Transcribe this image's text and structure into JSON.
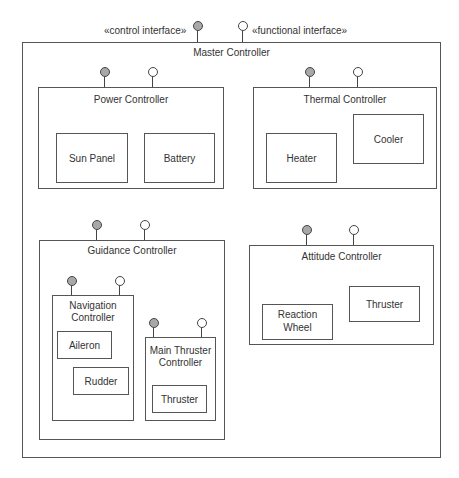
{
  "legend": {
    "control_interface": "«control interface»",
    "functional_interface": "«functional interface»"
  },
  "master": {
    "title": "Master Controller"
  },
  "power": {
    "title": "Power Controller",
    "parts": [
      "Sun Panel",
      "Battery"
    ]
  },
  "thermal": {
    "title": "Thermal Controller",
    "parts": [
      "Heater",
      "Cooler"
    ]
  },
  "guidance": {
    "title": "Guidance Controller",
    "navigation": {
      "title_line1": "Navigation",
      "title_line2": "Controller",
      "parts": [
        "Aileron",
        "Rudder"
      ]
    },
    "main_thruster": {
      "title_line1": "Main Thruster",
      "title_line2": "Controller",
      "parts": [
        "Thruster"
      ]
    }
  },
  "attitude": {
    "title": "Attitude Controller",
    "reaction_wheel_line1": "Reaction",
    "reaction_wheel_line2": "Wheel",
    "thruster": "Thruster"
  },
  "colors": {
    "control_interface_fill": "#a8a8a8",
    "functional_interface_fill": "#ffffff",
    "line": "#555555"
  }
}
